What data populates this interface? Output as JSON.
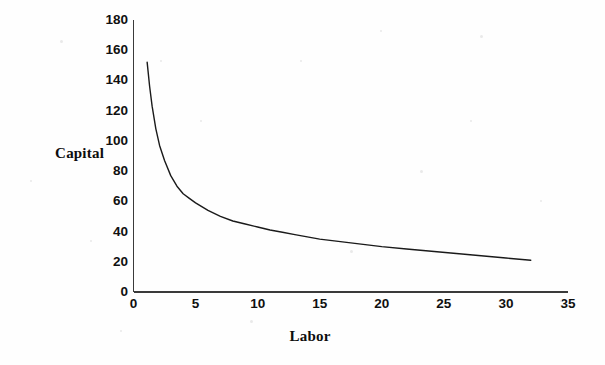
{
  "chart_data": {
    "type": "line",
    "title": "",
    "subtitle": "",
    "xlabel": "Labor",
    "ylabel": "Capital",
    "xlim": [
      0,
      35
    ],
    "ylim": [
      0,
      180
    ],
    "xticks": [
      "0",
      "5",
      "10",
      "15",
      "20",
      "25",
      "30",
      "35"
    ],
    "xtick_values": [
      0,
      5,
      10,
      15,
      20,
      25,
      30,
      35
    ],
    "yticks": [
      "0",
      "20",
      "40",
      "60",
      "80",
      "100",
      "120",
      "140",
      "160",
      "180"
    ],
    "ytick_values": [
      0,
      20,
      40,
      60,
      80,
      100,
      120,
      140,
      160,
      180
    ],
    "grid": false,
    "legend": null,
    "legend_position": "none",
    "series": [
      {
        "name": "Isoquant",
        "color": "#1a1a1a",
        "line_width": 1.4,
        "x": [
          1.1,
          1.3,
          1.5,
          1.8,
          2.1,
          2.5,
          3.0,
          3.5,
          4.0,
          4.5,
          5.0,
          6.0,
          7.0,
          8.0,
          9.0,
          10.0,
          11.0,
          12.0,
          13.0,
          14.0,
          15.0,
          16.0,
          17.0,
          18.0,
          19.0,
          20.0,
          22.0,
          24.0,
          26.0,
          28.0,
          30.0,
          32.0
        ],
        "y": [
          152.0,
          136.0,
          123.0,
          108.0,
          97.0,
          87.0,
          77.0,
          70.0,
          65.0,
          62.0,
          59.0,
          54.0,
          50.0,
          47.0,
          45.0,
          43.0,
          41.0,
          39.5,
          38.0,
          36.5,
          35.0,
          34.0,
          33.0,
          32.0,
          31.0,
          30.0,
          28.5,
          27.0,
          25.5,
          24.0,
          22.5,
          21.0
        ]
      }
    ],
    "axis_color": "#3a3a3a",
    "background": "#fefefe"
  }
}
